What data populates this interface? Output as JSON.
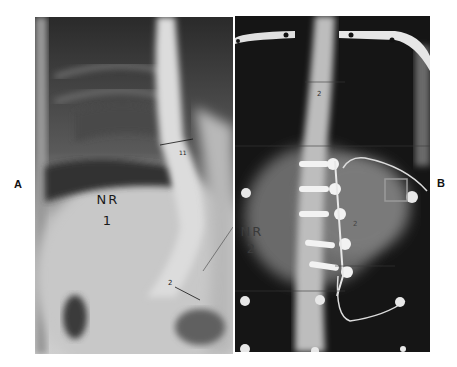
{
  "figure": {
    "panels": [
      {
        "id": "A",
        "label": "A",
        "annotation_line1": "NR",
        "annotation_line2": "1",
        "description": "Preoperative frontal radiograph showing scoliotic curvature of the spine"
      },
      {
        "id": "B",
        "label": "B",
        "annotation_line1": "NR",
        "annotation_line2": "2",
        "description": "Postoperative frontal radiograph with instrumentation screws and rod"
      }
    ]
  }
}
